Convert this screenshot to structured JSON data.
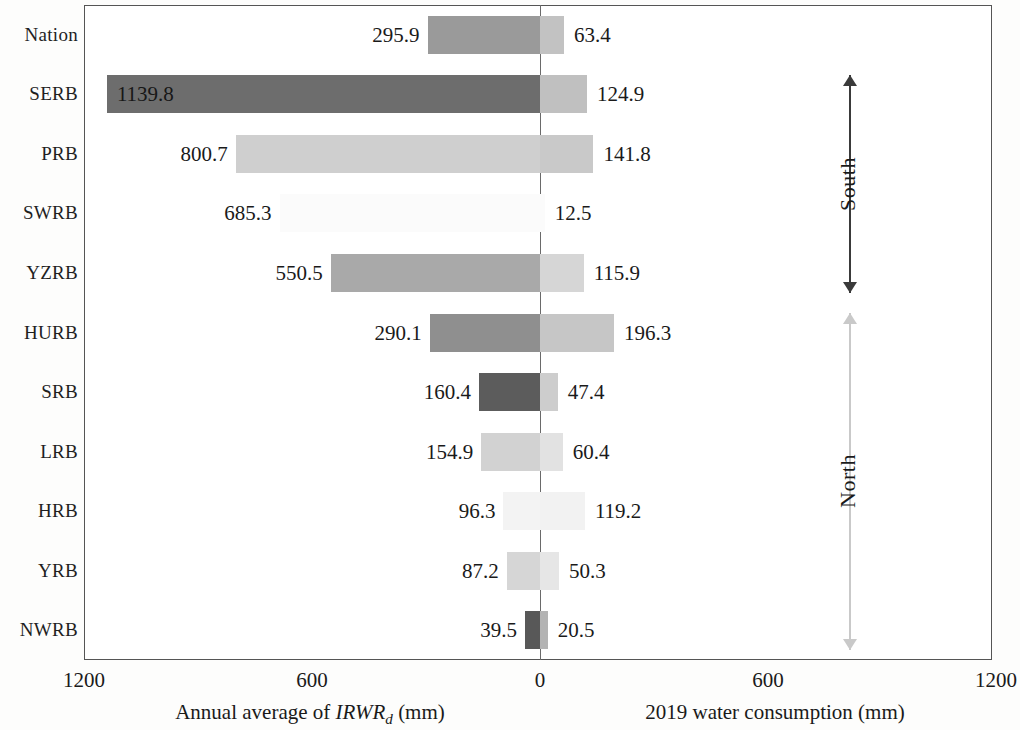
{
  "chart_data": {
    "type": "bar",
    "subtype": "diverging-horizontal-tornado",
    "title": "",
    "categories": [
      "Nation",
      "SERB",
      "PRB",
      "SWRB",
      "YZRB",
      "HURB",
      "SRB",
      "LRB",
      "HRB",
      "YRB",
      "NWRB"
    ],
    "series": [
      {
        "name": "Annual average of IRWRd (mm)",
        "side": "left",
        "values": [
          295.9,
          1139.8,
          800.7,
          685.3,
          550.5,
          290.1,
          160.4,
          154.9,
          96.3,
          87.2,
          39.5
        ]
      },
      {
        "name": "2019 water consumption (mm)",
        "side": "right",
        "values": [
          63.4,
          124.9,
          141.8,
          12.5,
          115.9,
          196.3,
          47.4,
          60.4,
          119.2,
          50.3,
          20.5
        ]
      }
    ],
    "left_axis": {
      "label_plain": "Annual average of IRWRd (mm)",
      "label_prefix": "Annual average of ",
      "label_italic": "IRWR",
      "label_sub": "d",
      "label_suffix": " (mm)",
      "ticks": [
        "1200",
        "600",
        "0"
      ],
      "range": [
        0,
        1200
      ],
      "direction": "reverse"
    },
    "right_axis": {
      "label_plain": "2019 water consumption (mm)",
      "ticks": [
        "0",
        "600",
        "1200"
      ],
      "range": [
        0,
        1200
      ],
      "direction": "normal"
    },
    "xticks": [
      "1200",
      "600",
      "0",
      "600",
      "1200"
    ],
    "grid": false,
    "legend": "none",
    "groups": [
      {
        "name": "South",
        "rows": [
          "SERB",
          "PRB",
          "SWRB",
          "YZRB"
        ],
        "arrow_color": "#3a3a3a"
      },
      {
        "name": "North",
        "rows": [
          "HURB",
          "SRB",
          "LRB",
          "HRB",
          "YRB",
          "NWRB"
        ],
        "arrow_color": "#c9c9c9"
      }
    ],
    "row_colors": [
      {
        "category": "Nation",
        "left": "#9a9a9a",
        "right": "#c2c2c2"
      },
      {
        "category": "SERB",
        "left": "#6d6d6d",
        "right": "#c0c0c0"
      },
      {
        "category": "PRB",
        "left": "#cfcfcf",
        "right": "#c9c9c9"
      },
      {
        "category": "SWRB",
        "left": "#fbfbfb",
        "right": "#fbfbfb"
      },
      {
        "category": "YZRB",
        "left": "#a9a9a9",
        "right": "#d6d6d6"
      },
      {
        "category": "HURB",
        "left": "#8f8f8f",
        "right": "#c6c6c6"
      },
      {
        "category": "SRB",
        "left": "#5c5c5c",
        "right": "#cdcdcd"
      },
      {
        "category": "LRB",
        "left": "#d2d2d2",
        "right": "#e2e2e2"
      },
      {
        "category": "HRB",
        "left": "#f3f3f3",
        "right": "#f2f2f2"
      },
      {
        "category": "YRB",
        "left": "#d6d6d6",
        "right": "#e6e6e6"
      },
      {
        "category": "NWRB",
        "left": "#585858",
        "right": "#b3b3b3"
      }
    ]
  },
  "axis": {
    "tick_1200_left": "1200",
    "tick_600_left": "600",
    "tick_zero": "0",
    "tick_600_right": "600",
    "tick_1200_right": "1200",
    "left_title_prefix": "Annual average of ",
    "left_title_italic": "IRWR",
    "left_title_sub": "d",
    "left_title_suffix": " (mm)",
    "right_title": "2019 water consumption (mm)"
  },
  "groups": {
    "south": "South",
    "north": "North"
  },
  "rows": [
    {
      "label": "Nation",
      "left": "295.9",
      "right": "63.4"
    },
    {
      "label": "SERB",
      "left": "1139.8",
      "right": "124.9"
    },
    {
      "label": "PRB",
      "left": "800.7",
      "right": "141.8"
    },
    {
      "label": "SWRB",
      "left": "685.3",
      "right": "12.5"
    },
    {
      "label": "YZRB",
      "left": "550.5",
      "right": "115.9"
    },
    {
      "label": "HURB",
      "left": "290.1",
      "right": "196.3"
    },
    {
      "label": "SRB",
      "left": "160.4",
      "right": "47.4"
    },
    {
      "label": "LRB",
      "left": "154.9",
      "right": "60.4"
    },
    {
      "label": "HRB",
      "left": "96.3",
      "right": "119.2"
    },
    {
      "label": "YRB",
      "left": "87.2",
      "right": "50.3"
    },
    {
      "label": "NWRB",
      "left": "39.5",
      "right": "20.5"
    }
  ]
}
